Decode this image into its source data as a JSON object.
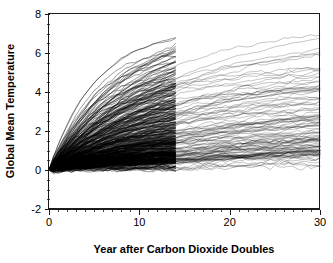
{
  "chart_data": {
    "type": "line",
    "title": "",
    "subtitle": "",
    "xlabel": "Year after Carbon Dioxide Doubles",
    "ylabel": "Global Mean Temperature",
    "xlim": [
      0,
      30
    ],
    "ylim": [
      -2,
      8
    ],
    "x_ticks": [
      0,
      10,
      20,
      30
    ],
    "x_tick_labels": [
      "0",
      "10",
      "20",
      "30"
    ],
    "x_minor_tick_interval": 1,
    "y_ticks": [
      -2,
      0,
      2,
      4,
      6,
      8
    ],
    "y_tick_labels": [
      "-2",
      "0",
      "2",
      "4",
      "6",
      "8"
    ],
    "y_minor_tick_interval": 0.5,
    "grid": false,
    "legend": false,
    "legend_position": "none",
    "series_count": 320,
    "line_color": "#000000",
    "background_color": "#ffffff",
    "frame_color": "#1a1a1a",
    "annotations": [
      {
        "label": "density-discontinuity",
        "x": 14,
        "note": "Line density drops sharply after year 14; fewer ensemble members continue beyond this point."
      }
    ],
    "envelope": {
      "x": [
        0,
        1,
        2,
        3,
        4,
        5,
        6,
        7,
        8,
        9,
        10,
        11,
        12,
        13,
        14,
        15,
        16,
        17,
        18,
        19,
        20,
        21,
        22,
        23,
        24,
        25,
        26,
        27,
        28,
        29,
        30
      ],
      "max": [
        0.0,
        1.05,
        1.95,
        2.75,
        3.45,
        4.1,
        4.7,
        5.2,
        5.65,
        6.05,
        6.45,
        6.8,
        7.1,
        7.35,
        7.55,
        4.95,
        5.0,
        5.05,
        5.15,
        5.25,
        5.35,
        5.45,
        5.55,
        5.6,
        5.7,
        5.75,
        5.8,
        5.85,
        5.88,
        5.9,
        5.95
      ],
      "upper_quartile": [
        0.0,
        0.62,
        1.15,
        1.62,
        2.05,
        2.42,
        2.78,
        3.08,
        3.35,
        3.6,
        3.82,
        4.02,
        4.2,
        4.35,
        4.48,
        3.95,
        4.0,
        4.05,
        4.1,
        4.15,
        4.2,
        4.25,
        4.3,
        4.35,
        4.4,
        4.45,
        4.5,
        4.55,
        4.6,
        4.65,
        4.72
      ],
      "median": [
        0.0,
        0.35,
        0.68,
        0.98,
        1.25,
        1.5,
        1.72,
        1.92,
        2.1,
        2.26,
        2.4,
        2.52,
        2.63,
        2.72,
        2.8,
        2.45,
        2.5,
        2.55,
        2.6,
        2.64,
        2.68,
        2.73,
        2.78,
        2.82,
        2.86,
        2.9,
        2.94,
        2.98,
        3.02,
        3.06,
        3.1
      ],
      "lower_quartile": [
        0.0,
        0.16,
        0.31,
        0.45,
        0.58,
        0.7,
        0.81,
        0.91,
        1.0,
        1.08,
        1.15,
        1.22,
        1.28,
        1.33,
        1.38,
        1.35,
        1.38,
        1.42,
        1.46,
        1.5,
        1.54,
        1.58,
        1.62,
        1.66,
        1.7,
        1.74,
        1.78,
        1.82,
        1.86,
        1.9,
        1.95
      ],
      "min": [
        0.0,
        -0.08,
        -0.12,
        -0.15,
        -0.18,
        -0.22,
        -0.25,
        -0.2,
        -0.18,
        -0.24,
        -0.15,
        -0.22,
        -0.18,
        -0.12,
        -0.2,
        0.68,
        0.7,
        0.72,
        0.74,
        0.76,
        0.78,
        0.8,
        0.82,
        0.83,
        0.85,
        0.86,
        0.88,
        0.9,
        0.92,
        0.95,
        0.98
      ]
    }
  }
}
